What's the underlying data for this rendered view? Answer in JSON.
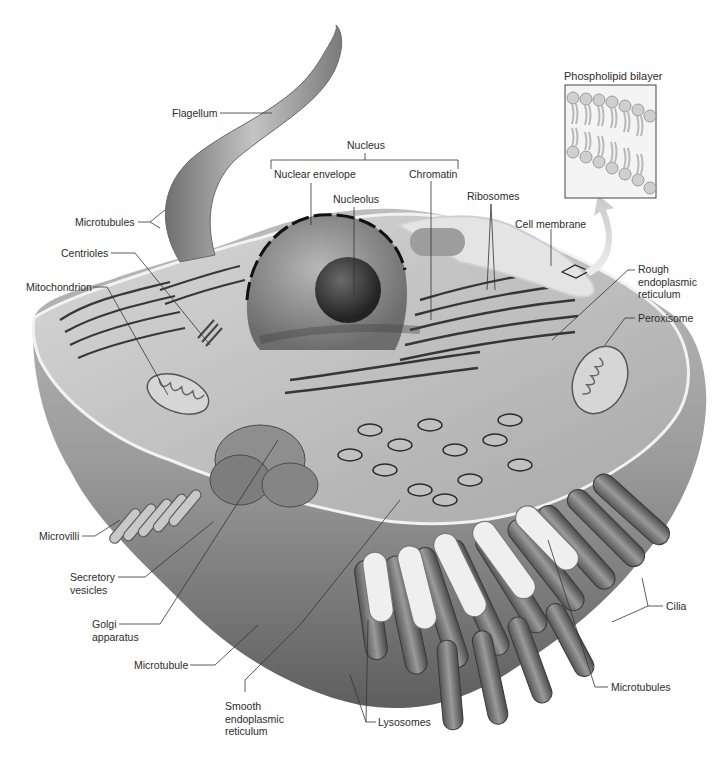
{
  "diagram": {
    "inset": {
      "title": "Phospholipid bilayer"
    },
    "labels": {
      "flagellum": "Flagellum",
      "nucleus": "Nucleus",
      "nuclear_envelope": "Nuclear envelope",
      "nucleolus": "Nucleolus",
      "chromatin": "Chromatin",
      "ribosomes": "Ribosomes",
      "cell_membrane": "Cell membrane",
      "rough_er": "Rough\nendoplasmic\nreticulum",
      "peroxisome": "Peroxisome",
      "microtubules_top": "Microtubules",
      "centrioles": "Centrioles",
      "mitochondrion": "Mitochondrion",
      "microvilli": "Microvilli",
      "secretory_vesicles": "Secretory\nvesicles",
      "golgi": "Golgi\napparatus",
      "microtubule": "Microtubule",
      "smooth_er": "Smooth\nendoplasmic\nreticulum",
      "lysosomes": "Lysosomes",
      "microtubules_bottom": "Microtubules",
      "cilia": "Cilia"
    },
    "colors": {
      "label_text": "#2b2b2b",
      "leader_line": "#333333",
      "cell_body": "#9a9a9a",
      "cell_highlight": "#d9d9d9",
      "cytoplasm": "#c8c8c8",
      "membrane": "#eeeeee",
      "nucleus": "#8c8c8c",
      "nucleolus": "#3a3a3a",
      "inset_arrow": "#d4d4d4"
    }
  }
}
